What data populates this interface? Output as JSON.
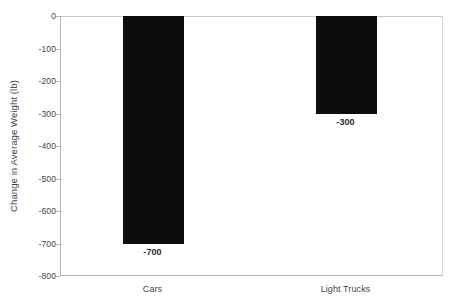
{
  "chart_data": {
    "type": "bar",
    "title": "",
    "xlabel": "",
    "ylabel": "Change in Average Weight (lb)",
    "categories": [
      "Cars",
      "Light Trucks"
    ],
    "values": [
      -700,
      -300
    ],
    "value_labels": [
      "-700",
      "-300"
    ],
    "ylim": [
      -800,
      0
    ],
    "y_ticks": [
      0,
      -100,
      -200,
      -300,
      -400,
      -500,
      -600,
      -700,
      -800
    ],
    "y_tick_labels": [
      "0",
      "-100",
      "-200",
      "-300",
      "-400",
      "-500",
      "-600",
      "-700",
      "-800"
    ],
    "grid": false,
    "legend": false,
    "legend_position": "none",
    "bar_color": "#0d0d0d",
    "axis_color": "#b4b4b4",
    "background_color": "#ffffff",
    "text_color": "#3f3f3f"
  }
}
